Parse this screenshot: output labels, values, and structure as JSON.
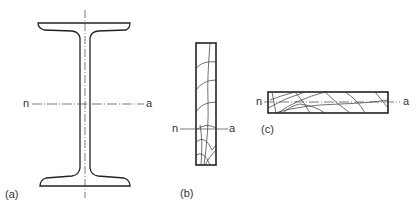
{
  "diagram": {
    "panels": [
      {
        "id": "a",
        "caption": "(a)",
        "shape": "I-beam cross-section",
        "axis_left": "n",
        "axis_right": "a"
      },
      {
        "id": "b",
        "caption": "(b)",
        "shape": "tall rectangle with crack pattern",
        "axis_left": "n",
        "axis_right": "a"
      },
      {
        "id": "c",
        "caption": "(c)",
        "shape": "wide rectangle with crack pattern",
        "axis_left": "n",
        "axis_right": "a"
      }
    ],
    "colors": {
      "line": "#222222",
      "background": "#ffffff"
    }
  }
}
